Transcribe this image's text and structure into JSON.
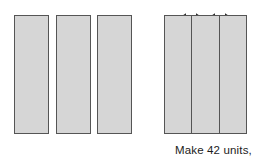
{
  "figure": {
    "width": 261,
    "height": 159,
    "background_color": "#ffffff",
    "fill_color": "#d6d6d6",
    "outline_color": "#555555",
    "text_color": "#1c1c1c"
  },
  "left_group": {
    "name": "separated-strips",
    "count": 3,
    "bars": [
      {
        "label": "strip-1",
        "x": 14,
        "y": 15,
        "width": 35,
        "height": 119
      },
      {
        "label": "strip-2",
        "x": 56,
        "y": 15,
        "width": 35,
        "height": 119
      },
      {
        "label": "strip-3",
        "x": 97,
        "y": 15,
        "width": 35,
        "height": 119
      }
    ]
  },
  "right_group": {
    "name": "joined-strips",
    "count": 3,
    "block": {
      "x": 164,
      "y": 15,
      "width": 83,
      "height": 119
    },
    "cells": [
      "strip-1",
      "strip-2",
      "strip-3"
    ]
  },
  "arrows": [
    {
      "label": "width-indicator-1",
      "x": 181,
      "y": 7,
      "width": 20,
      "style": "double-headed"
    },
    {
      "label": "width-indicator-2",
      "x": 210,
      "y": 7,
      "width": 20,
      "style": "double-headed"
    }
  ],
  "caption": {
    "text": "Make 42 units,",
    "x": 175,
    "y": 144
  }
}
